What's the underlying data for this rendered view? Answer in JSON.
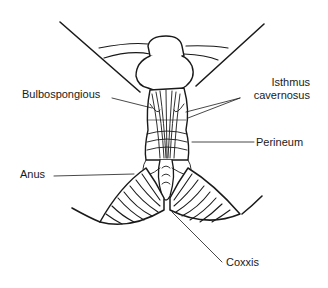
{
  "figure": {
    "type": "anatomical line drawing",
    "line_color": "#1a1a1a",
    "background": "#ffffff"
  },
  "labels": {
    "bulbospongious": "Bulbospongious",
    "isthmus_line1": "Isthmus",
    "isthmus_line2": "cavernosus",
    "perineum": "Perineum",
    "anus": "Anus",
    "coxxis": "Coxxis"
  }
}
